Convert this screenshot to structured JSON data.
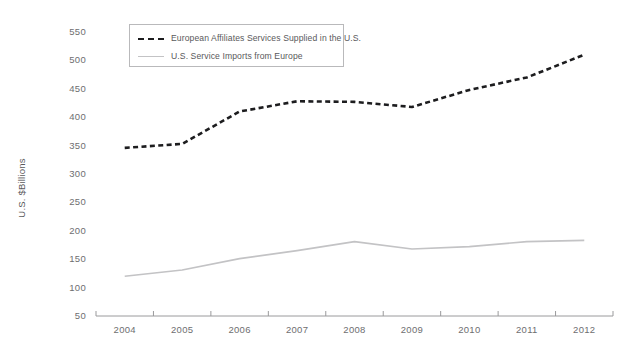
{
  "chart_data": {
    "type": "line",
    "title": "",
    "xlabel": "",
    "ylabel": "U.S. $Billions",
    "categories": [
      "2004",
      "2005",
      "2006",
      "2007",
      "2008",
      "2009",
      "2010",
      "2011",
      "2012"
    ],
    "x": [
      2004,
      2005,
      2006,
      2007,
      2008,
      2009,
      2010,
      2011,
      2012
    ],
    "ylim": [
      50,
      550
    ],
    "ytick_labels": [
      "550",
      "500",
      "450",
      "400",
      "350",
      "300",
      "250",
      "200",
      "150",
      "100",
      "50"
    ],
    "yticks": [
      550,
      500,
      450,
      400,
      350,
      300,
      250,
      200,
      150,
      100,
      50
    ],
    "grid": false,
    "legend_position": "top-left",
    "series": [
      {
        "name": "European Affiliates Services Supplied in the U.S.",
        "style": "dashed",
        "color": "#1d1d1f",
        "values": [
          346,
          353,
          410,
          428,
          427,
          418,
          448,
          470,
          510
        ]
      },
      {
        "name": "U.S. Service Imports from Europe",
        "style": "solid",
        "color": "#c3c3c5",
        "values": [
          120,
          131,
          151,
          165,
          181,
          168,
          172,
          181,
          183
        ]
      }
    ]
  },
  "axis": {
    "y_title": "U.S. $Billions"
  },
  "legend": {
    "items": [
      {
        "label": "European Affiliates Services Supplied in the U.S."
      },
      {
        "label": "U.S. Service Imports from Europe"
      }
    ]
  },
  "colors": {
    "series_primary": "#1d1d1f",
    "series_secondary": "#c3c3c5",
    "axis": "#9a9a9c",
    "text": "#6e6e70"
  }
}
